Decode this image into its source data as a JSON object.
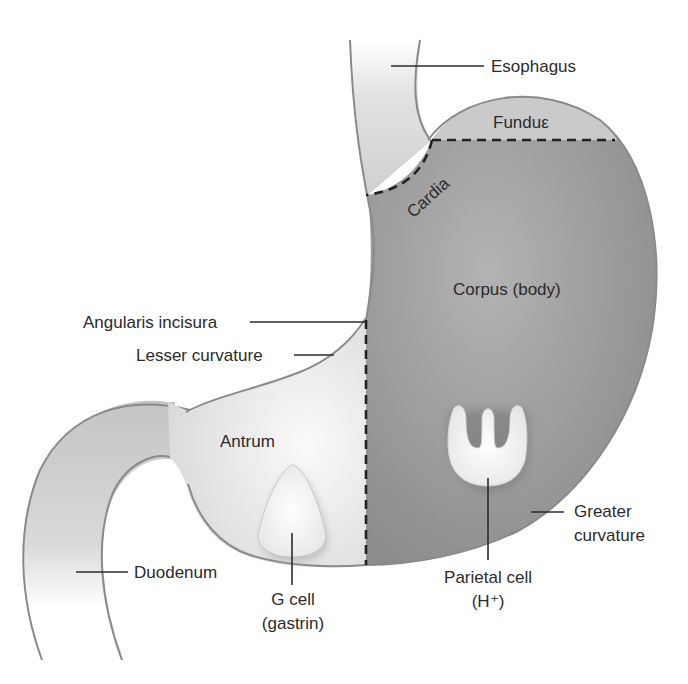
{
  "diagram": {
    "colors": {
      "corpus": "#8f8f8f",
      "fundus": "#c9c9c9",
      "antrum": "#ececec",
      "duodenum": "#cfcfcf",
      "outline": "#8a8a8a",
      "text": "#2b2b2b",
      "cell": "#f4f4f4"
    },
    "labels": {
      "esophagus": "Esophagus",
      "fundus": "Funduε",
      "cardia": "Cardia",
      "corpus": "Corpus (body)",
      "angularis_incisura": "Angularis incisura",
      "lesser_curvature": "Lesser curvature",
      "antrum": "Antrum",
      "greater_curvature_line1": "Greater",
      "greater_curvature_line2": "curvature",
      "duodenum": "Duodenum",
      "g_cell_line1": "G cell",
      "g_cell_line2": "(gastrin)",
      "parietal_cell_line1": "Parietal cell",
      "parietal_cell_line2": "(H⁺)"
    }
  }
}
